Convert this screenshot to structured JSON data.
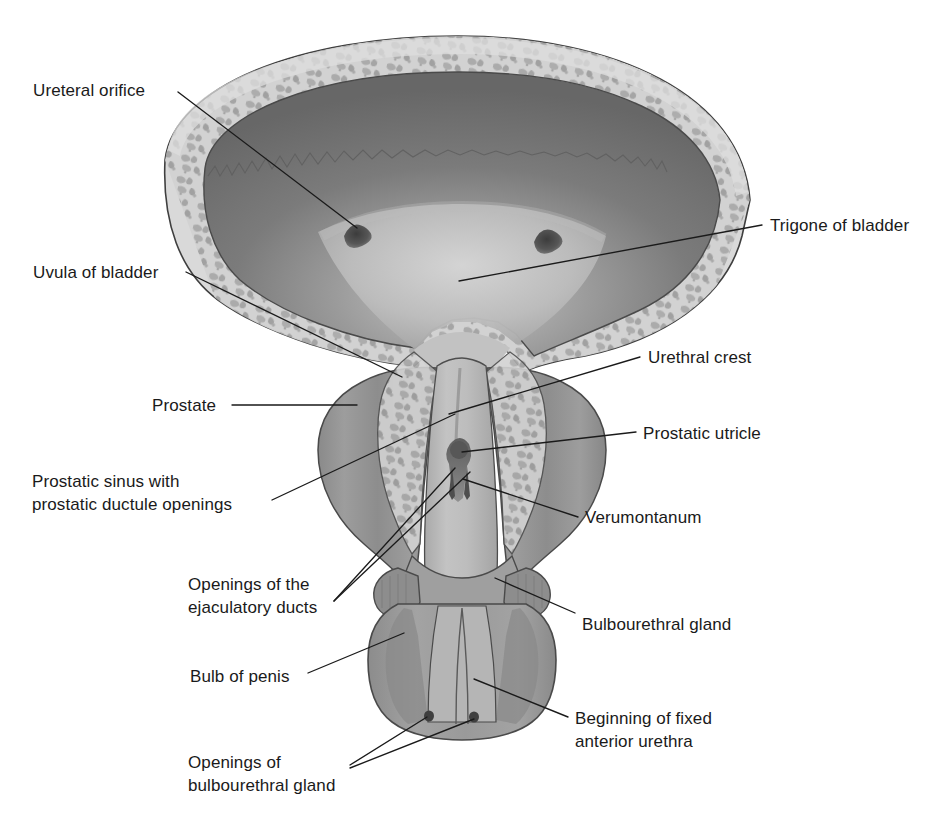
{
  "figure": {
    "type": "anatomical-illustration",
    "palette": {
      "background": "#ffffff",
      "outline": "#3a3a3a",
      "serosa": "#d9d9d9",
      "muscle_light": "#cfcfcf",
      "muscle_speckle": "#a6a6a6",
      "cavity_dark": "#6f6f6f",
      "cavity_mid": "#7d7d7d",
      "trigone_light": "#c8c8c8",
      "orifice_dark": "#4a4a4a",
      "prostate": "#8e8e8e",
      "prostate_dark": "#7a7a7a",
      "urethra_light": "#b9b9b9",
      "bulb": "#9a9a9a",
      "bulb_dark": "#808080",
      "verumontanum": "#5a5a5a",
      "label_text": "#1a1a1a"
    }
  },
  "labels": {
    "ureteral_orifice": "Ureteral orifice",
    "uvula_of_bladder": "Uvula of bladder",
    "prostate": "Prostate",
    "prostatic_sinus_line1": "Prostatic sinus with",
    "prostatic_sinus_line2": "prostatic ductule openings",
    "ejaculatory_ducts_line1": "Openings of the",
    "ejaculatory_ducts_line2": "ejaculatory ducts",
    "bulb_of_penis": "Bulb of penis",
    "openings_bulbourethral_line1": "Openings of",
    "openings_bulbourethral_line2": "bulbourethral gland",
    "trigone_of_bladder": "Trigone of bladder",
    "urethral_crest": "Urethral crest",
    "prostatic_utricle": "Prostatic utricle",
    "verumontanum": "Verumontanum",
    "bulbourethral_gland": "Bulbourethral gland",
    "beginning_fixed_urethra_line1": "Beginning of fixed",
    "beginning_fixed_urethra_line2": "anterior urethra"
  },
  "label_positions": {
    "ureteral_orifice": {
      "x": 33,
      "y": 80,
      "align": "left"
    },
    "uvula_of_bladder": {
      "x": 33,
      "y": 268,
      "align": "left"
    },
    "prostate": {
      "x": 152,
      "y": 396,
      "align": "left"
    },
    "prostatic_sinus": {
      "x": 32,
      "y": 477,
      "align": "left"
    },
    "ejaculatory_ducts": {
      "x": 188,
      "y": 578,
      "align": "left"
    },
    "bulb_of_penis": {
      "x": 190,
      "y": 673,
      "align": "left"
    },
    "openings_bulbourethral": {
      "x": 188,
      "y": 759,
      "align": "left"
    },
    "trigone_of_bladder": {
      "x": 770,
      "y": 217,
      "align": "left"
    },
    "urethral_crest": {
      "x": 648,
      "y": 348,
      "align": "left"
    },
    "prostatic_utricle": {
      "x": 643,
      "y": 424,
      "align": "left"
    },
    "verumontanum": {
      "x": 585,
      "y": 508,
      "align": "left"
    },
    "bulbourethral_gland": {
      "x": 582,
      "y": 616,
      "align": "left"
    },
    "beginning_fixed_urethra": {
      "x": 575,
      "y": 714,
      "align": "left"
    }
  },
  "leader_lines": [
    {
      "name": "ureteral-orifice-leader",
      "points": "178,92 357,228"
    },
    {
      "name": "uvula-of-bladder-leader",
      "points": "186,272 402,377"
    },
    {
      "name": "prostate-leader",
      "points": "232,405 357,405"
    },
    {
      "name": "prostatic-sinus-leader",
      "points": "272,500 455,414"
    },
    {
      "name": "ejaculatory-ducts-leader-a",
      "points": "334,601 455,468"
    },
    {
      "name": "ejaculatory-ducts-leader-b",
      "points": "334,601 470,472"
    },
    {
      "name": "bulb-of-penis-leader",
      "points": "308,673 404,633"
    },
    {
      "name": "openings-bulb-leader-a",
      "points": "350,765 427,717"
    },
    {
      "name": "openings-bulb-leader-b",
      "points": "350,768 474,719"
    },
    {
      "name": "trigone-leader",
      "points": "762,225 459,281"
    },
    {
      "name": "urethral-crest-leader",
      "points": "640,357 449,414"
    },
    {
      "name": "prostatic-utricle-leader",
      "points": "636,432 462,452"
    },
    {
      "name": "verumontanum-leader",
      "points": "578,517 463,479"
    },
    {
      "name": "bulbourethral-leader",
      "points": "575,613 495,578"
    },
    {
      "name": "beginning-urethra-leader",
      "points": "568,717 474,679"
    }
  ],
  "structures": [
    {
      "name": "bladder-dome",
      "label": "Bladder"
    },
    {
      "name": "bladder-wall-muscle",
      "label": "Detrusor muscle wall"
    },
    {
      "name": "bladder-cavity",
      "label": "Bladder cavity"
    },
    {
      "name": "trigone-region",
      "label": "Trigone"
    },
    {
      "name": "ureteral-orifice-left",
      "label": "Left ureteral orifice"
    },
    {
      "name": "ureteral-orifice-right",
      "label": "Right ureteral orifice"
    },
    {
      "name": "prostate-gland",
      "label": "Prostate"
    },
    {
      "name": "prostatic-urethra",
      "label": "Prostatic urethra"
    },
    {
      "name": "verumontanum-structure",
      "label": "Verumontanum"
    },
    {
      "name": "bulbourethral-gland-left",
      "label": "Left bulbourethral gland"
    },
    {
      "name": "bulbourethral-gland-right",
      "label": "Right bulbourethral gland"
    },
    {
      "name": "bulb-of-penis-structure",
      "label": "Bulb of penis"
    },
    {
      "name": "bulbourethral-opening-left",
      "label": "Left bulbourethral duct opening"
    },
    {
      "name": "bulbourethral-opening-right",
      "label": "Right bulbourethral duct opening"
    }
  ]
}
